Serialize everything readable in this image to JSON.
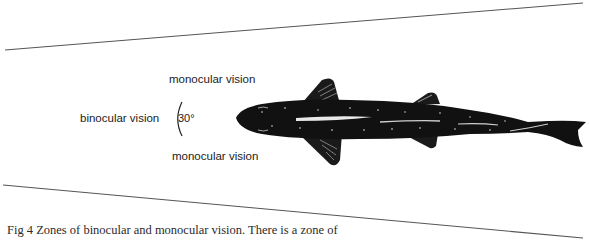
{
  "figure": {
    "labels": {
      "binocular": "binocular vision",
      "monocular_top": "monocular vision",
      "monocular_bottom": "monocular vision",
      "angle": "30°"
    },
    "caption": "Fig 4   Zones of binocular and monocular vision. There is a zone of",
    "colors": {
      "line": "#555555",
      "fish_body": "#111111",
      "fish_highlight": "#e8e8e8",
      "text": "#222222"
    },
    "sight_lines": [
      {
        "x1": 5,
        "y1": 50,
        "x2": 583,
        "y2": 3
      },
      {
        "x1": 3,
        "y1": 185,
        "x2": 583,
        "y2": 238
      }
    ],
    "apex": {
      "x": 218,
      "y": 118
    }
  }
}
